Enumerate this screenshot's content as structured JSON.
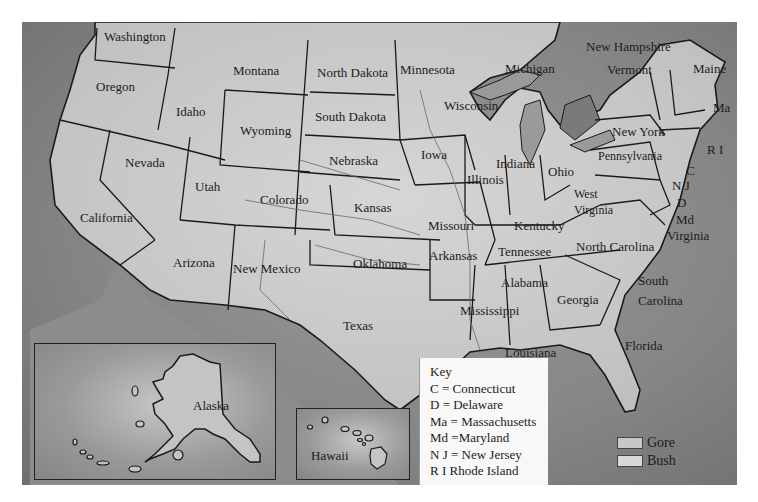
{
  "map": {
    "title": "US Presidential Election 2000 Map",
    "states": [
      {
        "id": "washington",
        "label": "Washington",
        "x": 104,
        "y": 30
      },
      {
        "id": "oregon",
        "label": "Oregon",
        "x": 96,
        "y": 80
      },
      {
        "id": "idaho",
        "label": "Idaho",
        "x": 176,
        "y": 105
      },
      {
        "id": "montana",
        "label": "Montana",
        "x": 233,
        "y": 64
      },
      {
        "id": "wyoming",
        "label": "Wyoming",
        "x": 240,
        "y": 124
      },
      {
        "id": "nevada",
        "label": "Nevada",
        "x": 125,
        "y": 156
      },
      {
        "id": "utah",
        "label": "Utah",
        "x": 195,
        "y": 180
      },
      {
        "id": "california",
        "label": "California",
        "x": 80,
        "y": 211
      },
      {
        "id": "colorado",
        "label": "Colorado",
        "x": 260,
        "y": 193
      },
      {
        "id": "arizona",
        "label": "Arizona",
        "x": 173,
        "y": 256
      },
      {
        "id": "new-mexico",
        "label": "New Mexico",
        "x": 233,
        "y": 262
      },
      {
        "id": "north-dakota",
        "label": "North Dakota",
        "x": 317,
        "y": 66
      },
      {
        "id": "south-dakota",
        "label": "South Dakota",
        "x": 315,
        "y": 110
      },
      {
        "id": "nebraska",
        "label": "Nebraska",
        "x": 329,
        "y": 154
      },
      {
        "id": "kansas",
        "label": "Kansas",
        "x": 354,
        "y": 201
      },
      {
        "id": "oklahoma",
        "label": "Oklahoma",
        "x": 353,
        "y": 257
      },
      {
        "id": "texas",
        "label": "Texas",
        "x": 343,
        "y": 319
      },
      {
        "id": "minnesota",
        "label": "Minnesota",
        "x": 400,
        "y": 63
      },
      {
        "id": "iowa",
        "label": "Iowa",
        "x": 421,
        "y": 148
      },
      {
        "id": "missouri",
        "label": "Missouri",
        "x": 428,
        "y": 219
      },
      {
        "id": "arkansas",
        "label": "Arkansas",
        "x": 429,
        "y": 249
      },
      {
        "id": "louisiana",
        "label": "Louisiana",
        "x": 505,
        "y": 346
      },
      {
        "id": "wisconsin",
        "label": "Wisconsin",
        "x": 444,
        "y": 99
      },
      {
        "id": "illinois",
        "label": "Illinois",
        "x": 467,
        "y": 173
      },
      {
        "id": "michigan",
        "label": "Michigan",
        "x": 505,
        "y": 62
      },
      {
        "id": "indiana",
        "label": "Indiana",
        "x": 496,
        "y": 157
      },
      {
        "id": "ohio",
        "label": "Ohio",
        "x": 548,
        "y": 165
      },
      {
        "id": "kentucky",
        "label": "Kentucky",
        "x": 514,
        "y": 219
      },
      {
        "id": "tennessee",
        "label": "Tennessee",
        "x": 498,
        "y": 245
      },
      {
        "id": "mississippi",
        "label": "Mississippi",
        "x": 460,
        "y": 304
      },
      {
        "id": "alabama",
        "label": "Alabama",
        "x": 501,
        "y": 276
      },
      {
        "id": "georgia",
        "label": "Georgia",
        "x": 557,
        "y": 293
      },
      {
        "id": "florida",
        "label": "Florida",
        "x": 625,
        "y": 339
      },
      {
        "id": "south-carolina",
        "label": "South",
        "label2": "Carolina",
        "x": 638,
        "y": 271
      },
      {
        "id": "north-carolina",
        "label": "North Carolina",
        "x": 576,
        "y": 240
      },
      {
        "id": "virginia",
        "label": "Virginia",
        "x": 667,
        "y": 229
      },
      {
        "id": "west-virginia",
        "label": "West",
        "label2": "Virginia",
        "x": 574,
        "y": 186
      },
      {
        "id": "pennsylvania",
        "label": "Pennsylvania",
        "x": 598,
        "y": 150
      },
      {
        "id": "new-york",
        "label": "New York",
        "x": 612,
        "y": 125
      },
      {
        "id": "vermont",
        "label": "Vermont",
        "x": 607,
        "y": 63
      },
      {
        "id": "new-hampshire",
        "label": "New Hampshire",
        "x": 586,
        "y": 40
      },
      {
        "id": "maine",
        "label": "Maine",
        "x": 693,
        "y": 62
      },
      {
        "id": "massachusetts",
        "label": "Ma",
        "x": 713,
        "y": 101
      },
      {
        "id": "rhode-island",
        "label": "R I",
        "x": 707,
        "y": 143
      },
      {
        "id": "connecticut",
        "label": "C",
        "x": 686,
        "y": 164
      },
      {
        "id": "new-jersey",
        "label": "N J",
        "x": 672,
        "y": 179
      },
      {
        "id": "delaware",
        "label": "D",
        "x": 677,
        "y": 196
      },
      {
        "id": "maryland",
        "label": "Md",
        "x": 676,
        "y": 213
      }
    ],
    "insets": {
      "alaska": {
        "label": "Alaska"
      },
      "hawaii": {
        "label": "Hawaii"
      }
    }
  },
  "key": {
    "title": "Key",
    "items": [
      "C = Connecticut",
      "D = Delaware",
      "Ma = Massachusetts",
      "Md =Maryland",
      "N J = New Jersey",
      "R I Rhode Island"
    ]
  },
  "legend": {
    "items": [
      {
        "label": "Gore",
        "color": "#c8c8c8"
      },
      {
        "label": "Bush",
        "color": "#d8d8d8"
      }
    ]
  },
  "colors": {
    "land": "#c6c6c6",
    "water": "#8a8a8a",
    "border": "#1a1a1a",
    "lake": "#7a7a7a"
  }
}
